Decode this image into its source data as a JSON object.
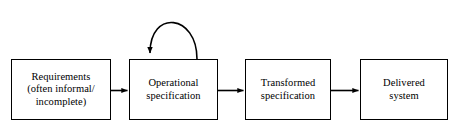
{
  "diagram": {
    "background_color": "#ffffff",
    "stroke_color": "#000000",
    "nodes": [
      {
        "id": "requirements",
        "label": "Requirements\n(often informal/\nincomplete)",
        "x": 11,
        "y": 59,
        "width": 100,
        "height": 61
      },
      {
        "id": "operational",
        "label": "Operational\nspecification",
        "x": 129,
        "y": 59,
        "width": 89,
        "height": 61
      },
      {
        "id": "transformed",
        "label": "Transformed\nspecification",
        "x": 245,
        "y": 59,
        "width": 86,
        "height": 61
      },
      {
        "id": "delivered",
        "label": "Delivered\nsystem",
        "x": 360,
        "y": 59,
        "width": 88,
        "height": 61
      }
    ],
    "edges": [
      {
        "id": "requirements-to-operational",
        "from": "requirements",
        "to": "operational",
        "kind": "straight-arrow"
      },
      {
        "id": "operational-to-transformed",
        "from": "operational",
        "to": "transformed",
        "kind": "straight-arrow"
      },
      {
        "id": "transformed-to-delivered",
        "from": "transformed",
        "to": "delivered",
        "kind": "straight-arrow"
      },
      {
        "id": "operational-self-loop",
        "from": "operational",
        "to": "operational",
        "kind": "self-loop-arc"
      }
    ]
  }
}
